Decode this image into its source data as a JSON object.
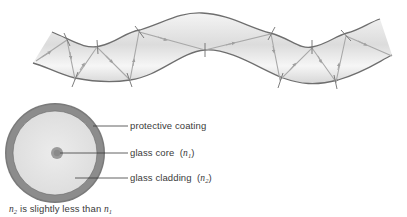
{
  "diagram": {
    "fiber": {
      "description": "curved optical fiber showing light ray total internal reflection",
      "tube_fill": "#e8e8e8",
      "tube_edge": "#6e6e6e",
      "ray_color": "#a8a8a8"
    },
    "cross_section": {
      "coating_color": "#7a7a7a",
      "cladding_color": "#e4e4e4",
      "core_color": "#9a9a9a"
    },
    "labels": {
      "protective_coating": "protective coating",
      "glass_core": "glass core",
      "glass_core_index_symbol": "n",
      "glass_core_index_sub": "1",
      "glass_cladding": "glass cladding",
      "glass_cladding_index_symbol": "n",
      "glass_cladding_index_sub": "2"
    },
    "caption": {
      "symbol_a": "n",
      "sub_a": "2",
      "text": " is slightly less than ",
      "symbol_b": "n",
      "sub_b": "1"
    }
  }
}
